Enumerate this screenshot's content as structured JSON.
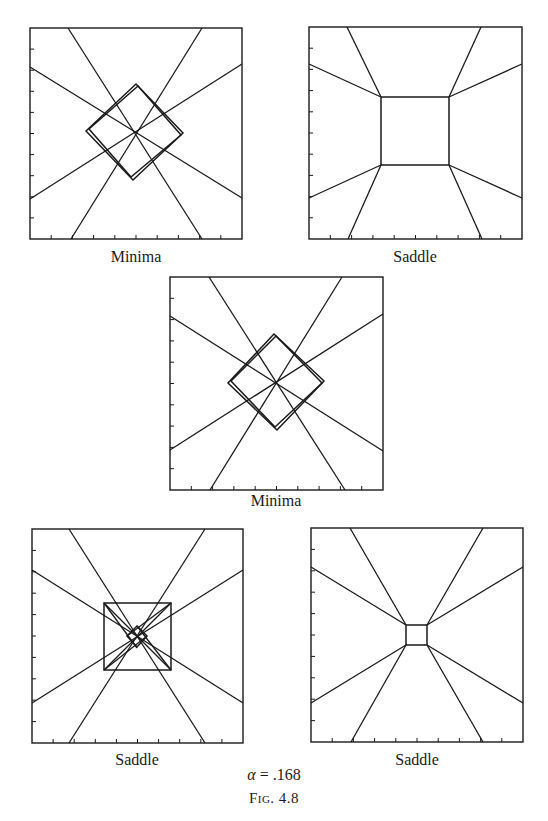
{
  "page": {
    "figure_label": "Fig. 4.8",
    "alpha_symbol": "α",
    "alpha_equals": " = .168"
  },
  "colors": {
    "ink": "#1a1a1a",
    "background": "#ffffff"
  },
  "panels": [
    {
      "id": "p1",
      "label": "Minima",
      "box": [
        30,
        28,
        242,
        239
      ],
      "lines": [
        [
          68,
          28,
          202,
          239
        ],
        [
          202,
          28,
          71,
          239
        ],
        [
          30,
          67,
          242,
          198
        ],
        [
          30,
          199,
          242,
          64
        ]
      ],
      "polys": [
        [
          [
            136,
            84
          ],
          [
            86,
            131
          ],
          [
            133,
            180
          ],
          [
            183,
            133
          ]
        ],
        [
          [
            138,
            86
          ],
          [
            89,
            129
          ],
          [
            131,
            177
          ],
          [
            181,
            135
          ]
        ]
      ]
    },
    {
      "id": "p2",
      "label": "Saddle",
      "box": [
        309,
        27,
        522,
        239
      ],
      "lines": [
        [
          347,
          27,
          381,
          97
        ],
        [
          481,
          27,
          449,
          97
        ],
        [
          309,
          64,
          381,
          97
        ],
        [
          522,
          64,
          449,
          97
        ],
        [
          309,
          198,
          381,
          165
        ],
        [
          522,
          198,
          449,
          165
        ],
        [
          348,
          239,
          381,
          165
        ],
        [
          482,
          239,
          449,
          165
        ]
      ],
      "polys": [
        [
          [
            381,
            97
          ],
          [
            449,
            97
          ],
          [
            449,
            165
          ],
          [
            381,
            165
          ]
        ]
      ]
    },
    {
      "id": "p3",
      "label": "Minima",
      "box": [
        170,
        277,
        383,
        490
      ],
      "lines": [
        [
          209,
          277,
          345,
          490
        ],
        [
          342,
          277,
          210,
          490
        ],
        [
          170,
          316,
          383,
          451
        ],
        [
          170,
          450,
          383,
          314
        ]
      ],
      "polys": [
        [
          [
            274,
            334
          ],
          [
            228,
            383
          ],
          [
            277,
            430
          ],
          [
            324,
            381
          ]
        ],
        [
          [
            276,
            336
          ],
          [
            231,
            381
          ],
          [
            275,
            427
          ],
          [
            322,
            383
          ]
        ]
      ]
    },
    {
      "id": "p4",
      "label": "Saddle",
      "box": [
        32,
        529,
        243,
        743
      ],
      "lines": [
        [
          69,
          529,
          205,
          743
        ],
        [
          205,
          529,
          69,
          743
        ],
        [
          32,
          570,
          243,
          703
        ],
        [
          243,
          570,
          32,
          703
        ],
        [
          104,
          603,
          171,
          670
        ],
        [
          171,
          603,
          104,
          670
        ],
        [
          104,
          603,
          137,
          648
        ],
        [
          171,
          603,
          127,
          636
        ],
        [
          104,
          670,
          147,
          636
        ],
        [
          171,
          670,
          137,
          626
        ]
      ],
      "polys": [
        [
          [
            104,
            603
          ],
          [
            171,
            603
          ],
          [
            171,
            670
          ],
          [
            104,
            670
          ]
        ],
        [
          [
            137,
            626
          ],
          [
            147,
            636
          ],
          [
            137,
            647
          ],
          [
            127,
            636
          ]
        ]
      ]
    },
    {
      "id": "p5",
      "label": "Saddle",
      "box": [
        311,
        528,
        523,
        742
      ],
      "lines": [
        [
          350,
          528,
          406,
          625
        ],
        [
          483,
          528,
          427,
          625
        ],
        [
          311,
          567,
          406,
          625
        ],
        [
          523,
          567,
          427,
          625
        ],
        [
          311,
          703,
          406,
          645
        ],
        [
          523,
          703,
          427,
          645
        ],
        [
          351,
          742,
          406,
          645
        ],
        [
          483,
          742,
          427,
          645
        ]
      ],
      "polys": [
        [
          [
            406,
            625
          ],
          [
            427,
            625
          ],
          [
            427,
            645
          ],
          [
            406,
            645
          ]
        ]
      ]
    }
  ],
  "axis": {
    "tick_count": 9,
    "tick_length": 4
  }
}
